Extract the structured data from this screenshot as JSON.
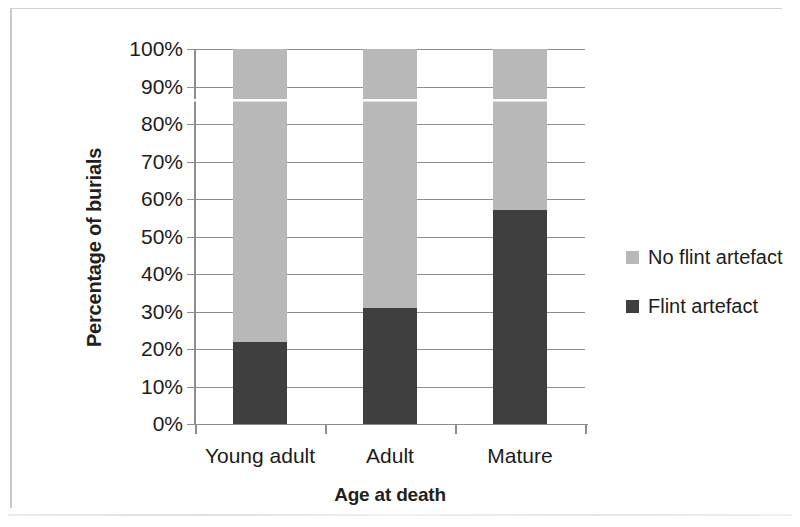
{
  "chart_data": {
    "type": "bar",
    "subtype": "stacked-100-percent",
    "title": "",
    "xlabel": "Age at death",
    "ylabel": "Percentage of burials",
    "categories": [
      "Young adult",
      "Adult",
      "Mature"
    ],
    "series": [
      {
        "name": "Flint artefact",
        "values": [
          22,
          31,
          57
        ],
        "color": "#3f3f3f",
        "stack_position": "bottom"
      },
      {
        "name": "No flint artefact",
        "values": [
          78,
          69,
          43
        ],
        "color": "#b8b8b8",
        "stack_position": "top"
      }
    ],
    "ylim": [
      0,
      100
    ],
    "ytick_step": 10,
    "ytick_labels": [
      "0%",
      "10%",
      "20%",
      "30%",
      "40%",
      "50%",
      "60%",
      "70%",
      "80%",
      "90%",
      "100%"
    ],
    "ytick_values": [
      0,
      10,
      20,
      30,
      40,
      50,
      60,
      70,
      80,
      90,
      100
    ],
    "grid": true,
    "grid_axis": "y",
    "legend_position": "right",
    "legend_order": [
      "No flint artefact",
      "Flint artefact"
    ]
  },
  "legend": {
    "items": [
      {
        "label": "No flint artefact",
        "color": "#b8b8b8"
      },
      {
        "label": "Flint artefact",
        "color": "#3f3f3f"
      }
    ]
  }
}
